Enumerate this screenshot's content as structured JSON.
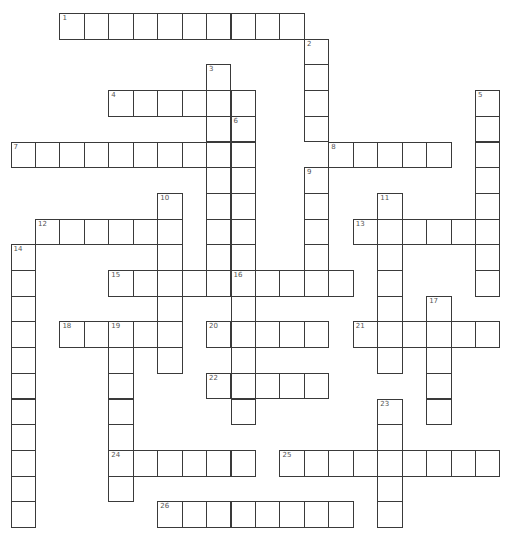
{
  "puzzle": {
    "type": "crossword",
    "grid": {
      "origin_x": 10.5,
      "origin_y": 13,
      "cell_w": 24.45,
      "cell_h": 25.7
    },
    "colors": {
      "line": "#3a3a3a",
      "background": "#ffffff",
      "number": "#555555"
    },
    "across": [
      {
        "number": "1",
        "row": 0,
        "col": 2,
        "length": 10
      },
      {
        "number": "4",
        "row": 3,
        "col": 4,
        "length": 6
      },
      {
        "number": "7",
        "row": 5,
        "col": 0,
        "length": 9
      },
      {
        "number": "8",
        "row": 5,
        "col": 13,
        "length": 5
      },
      {
        "number": "12",
        "row": 8,
        "col": 1,
        "length": 6
      },
      {
        "number": "13",
        "row": 8,
        "col": 14,
        "length": 6
      },
      {
        "number": "15",
        "row": 10,
        "col": 4,
        "length": 5
      },
      {
        "number": "16",
        "row": 10,
        "col": 9,
        "length": 5
      },
      {
        "number": "18",
        "row": 12,
        "col": 2,
        "length": 5
      },
      {
        "number": "20",
        "row": 12,
        "col": 8,
        "length": 5
      },
      {
        "number": "21",
        "row": 12,
        "col": 14,
        "length": 6
      },
      {
        "number": "22",
        "row": 14,
        "col": 8,
        "length": 5
      },
      {
        "number": "24",
        "row": 17,
        "col": 4,
        "length": 6
      },
      {
        "number": "25",
        "row": 17,
        "col": 11,
        "length": 9
      },
      {
        "number": "26",
        "row": 19,
        "col": 6,
        "length": 8
      }
    ],
    "down": [
      {
        "number": "2",
        "row": 1,
        "col": 12,
        "length": 4
      },
      {
        "number": "3",
        "row": 2,
        "col": 8,
        "length": 9
      },
      {
        "number": "5",
        "row": 3,
        "col": 19,
        "length": 8
      },
      {
        "number": "6",
        "row": 4,
        "col": 9,
        "length": 12
      },
      {
        "number": "9",
        "row": 6,
        "col": 12,
        "length": 5
      },
      {
        "number": "10",
        "row": 7,
        "col": 6,
        "length": 7
      },
      {
        "number": "11",
        "row": 7,
        "col": 15,
        "length": 7
      },
      {
        "number": "14",
        "row": 9,
        "col": 0,
        "length": 11
      },
      {
        "number": "17",
        "row": 11,
        "col": 17,
        "length": 5
      },
      {
        "number": "19",
        "row": 12,
        "col": 4,
        "length": 7
      },
      {
        "number": "23",
        "row": 15,
        "col": 15,
        "length": 5
      }
    ]
  }
}
